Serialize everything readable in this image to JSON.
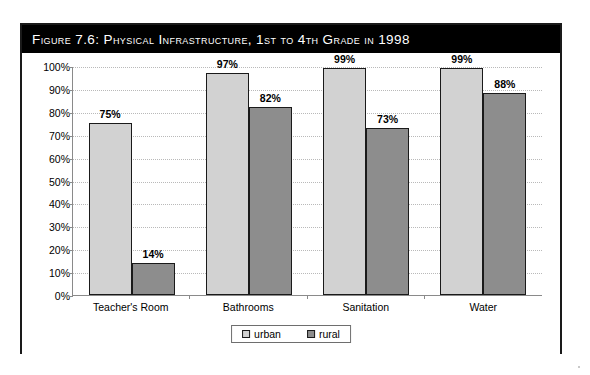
{
  "figure": {
    "title": "Figure 7.6:  Physical Infrastructure, 1st to 4th Grade in 1998"
  },
  "chart_data": {
    "type": "bar",
    "title": "Figure 7.6:  Physical Infrastructure, 1st to 4th Grade in 1998",
    "xlabel": "",
    "ylabel": "",
    "ylim": [
      0,
      100
    ],
    "ytick_labels": [
      "100%",
      "90%",
      "80%",
      "70%",
      "60%",
      "50%",
      "40%",
      "30%",
      "20%",
      "10%",
      "0%"
    ],
    "ytick_values": [
      100,
      90,
      80,
      70,
      60,
      50,
      40,
      30,
      20,
      10,
      0
    ],
    "grid": true,
    "legend_position": "bottom-center",
    "categories": [
      "Teacher's Room",
      "Bathrooms",
      "Sanitation",
      "Water"
    ],
    "series": [
      {
        "name": "urban",
        "color": "#d2d2d2",
        "values": [
          75,
          97,
          99,
          99
        ],
        "labels": [
          "75%",
          "97%",
          "99%",
          "99%"
        ]
      },
      {
        "name": "rural",
        "color": "#8d8d8d",
        "values": [
          14,
          82,
          73,
          88
        ],
        "labels": [
          "14%",
          "82%",
          "73%",
          "88%"
        ]
      }
    ]
  },
  "colors": {
    "title_bar_bg": "#000000",
    "title_text": "#ffffff",
    "urban_fill": "#d2d2d2",
    "rural_fill": "#8d8d8d",
    "bar_border": "#1a1a1a",
    "axis": "#8a8a8a",
    "gridline": "#b9b9b9",
    "frame": "#1a1a1a"
  }
}
